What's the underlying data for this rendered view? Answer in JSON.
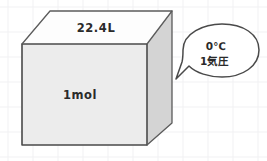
{
  "diagram": {
    "background_color": "#ffffff",
    "grid_color": "#f1f1f3",
    "grid_spacing": 25
  },
  "cube": {
    "name": "gas-volume-cube",
    "top_label": "22.4L",
    "front_label": "1mol",
    "top_face_color": "#fdfdfd",
    "front_face_color": "#ececec",
    "side_face_color": "#d4d4d4",
    "edge_color": "#4a4a4a"
  },
  "callout": {
    "name": "condition-speech-bubble",
    "line1": "0℃",
    "line2": "1気圧",
    "fill_color": "#ffffff",
    "stroke_color": "#4a4a4a"
  }
}
